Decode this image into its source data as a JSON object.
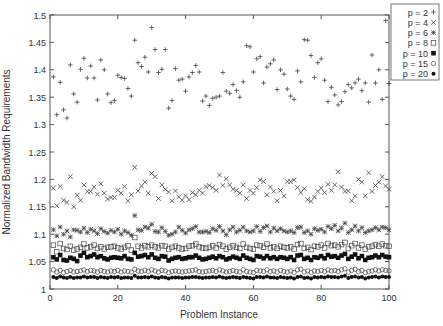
{
  "chart_data": {
    "type": "scatter",
    "title": "",
    "xlabel": "Problem Instance",
    "ylabel": "Normalized Bandwidth Requirements",
    "xlim": [
      0,
      100
    ],
    "ylim": [
      1.0,
      1.5
    ],
    "xticks": [
      0,
      20,
      40,
      60,
      80,
      100
    ],
    "yticks": [
      1,
      1.05,
      1.1,
      1.15,
      1.2,
      1.25,
      1.3,
      1.35,
      1.4,
      1.45,
      1.5
    ],
    "grid": false,
    "legend_position": "upper right, outside plot",
    "series": [
      {
        "name": "p = 2",
        "marker": "plus",
        "values": [
          1.387,
          1.318,
          1.377,
          1.327,
          1.312,
          1.409,
          1.356,
          1.341,
          1.401,
          1.421,
          1.385,
          1.407,
          1.385,
          1.345,
          1.418,
          1.4,
          1.356,
          1.34,
          1.344,
          1.39,
          1.386,
          1.384,
          1.366,
          1.352,
          1.454,
          1.413,
          1.406,
          1.423,
          1.396,
          1.477,
          1.437,
          1.395,
          1.401,
          1.437,
          1.33,
          1.344,
          1.402,
          1.381,
          1.383,
          1.361,
          1.387,
          1.395,
          1.408,
          1.396,
          1.343,
          1.352,
          1.335,
          1.348,
          1.35,
          1.352,
          1.395,
          1.361,
          1.357,
          1.373,
          1.362,
          1.35,
          1.378,
          1.444,
          1.442,
          1.396,
          1.42,
          1.424,
          1.376,
          1.405,
          1.411,
          1.418,
          1.364,
          1.4,
          1.392,
          1.365,
          1.352,
          1.346,
          1.398,
          1.378,
          1.455,
          1.454,
          1.426,
          1.386,
          1.413,
          1.42,
          1.381,
          1.342,
          1.368,
          1.354,
          1.336,
          1.342,
          1.36,
          1.373,
          1.367,
          1.376,
          1.383,
          1.362,
          1.376,
          1.341,
          1.427,
          1.376,
          1.4,
          1.346,
          1.49,
          1.375
        ]
      },
      {
        "name": "p = 4",
        "marker": "cross",
        "values": [
          1.184,
          1.152,
          1.187,
          1.162,
          1.158,
          1.205,
          1.15,
          1.171,
          1.162,
          1.19,
          1.178,
          1.178,
          1.186,
          1.173,
          1.192,
          1.175,
          1.164,
          1.167,
          1.167,
          1.18,
          1.175,
          1.187,
          1.161,
          1.172,
          1.222,
          1.179,
          1.188,
          1.195,
          1.175,
          1.211,
          1.205,
          1.165,
          1.19,
          1.182,
          1.177,
          1.161,
          1.179,
          1.168,
          1.162,
          1.17,
          1.163,
          1.176,
          1.172,
          1.18,
          1.175,
          1.187,
          1.189,
          1.185,
          1.18,
          1.208,
          1.189,
          1.201,
          1.19,
          1.182,
          1.18,
          1.175,
          1.19,
          1.165,
          1.18,
          1.175,
          1.185,
          1.199,
          1.196,
          1.172,
          1.186,
          1.178,
          1.161,
          1.18,
          1.17,
          1.196,
          1.196,
          1.199,
          1.185,
          1.176,
          1.183,
          1.163,
          1.16,
          1.168,
          1.178,
          1.184,
          1.176,
          1.191,
          1.18,
          1.19,
          1.214,
          1.186,
          1.178,
          1.179,
          1.161,
          1.17,
          1.2,
          1.195,
          1.17,
          1.212,
          1.178,
          1.189,
          1.195,
          1.205,
          1.188,
          1.182
        ]
      },
      {
        "name": "p = 6",
        "marker": "star",
        "values": [
          1.108,
          1.097,
          1.113,
          1.1,
          1.106,
          1.095,
          1.108,
          1.107,
          1.104,
          1.111,
          1.103,
          1.109,
          1.106,
          1.101,
          1.11,
          1.105,
          1.102,
          1.107,
          1.104,
          1.109,
          1.1,
          1.106,
          1.103,
          1.098,
          1.134,
          1.108,
          1.107,
          1.113,
          1.111,
          1.118,
          1.105,
          1.104,
          1.112,
          1.105,
          1.098,
          1.1,
          1.104,
          1.113,
          1.107,
          1.102,
          1.108,
          1.11,
          1.114,
          1.104,
          1.104,
          1.105,
          1.103,
          1.11,
          1.107,
          1.114,
          1.106,
          1.099,
          1.108,
          1.113,
          1.104,
          1.107,
          1.113,
          1.106,
          1.104,
          1.106,
          1.114,
          1.105,
          1.112,
          1.115,
          1.104,
          1.111,
          1.106,
          1.11,
          1.106,
          1.104,
          1.106,
          1.103,
          1.112,
          1.113,
          1.103,
          1.106,
          1.1,
          1.11,
          1.107,
          1.109,
          1.104,
          1.114,
          1.11,
          1.116,
          1.106,
          1.111,
          1.12,
          1.103,
          1.108,
          1.115,
          1.106,
          1.112,
          1.103,
          1.106,
          1.108,
          1.112,
          1.108,
          1.113,
          1.112,
          1.108
        ]
      },
      {
        "name": "p = 8",
        "marker": "open-square",
        "values": [
          1.08,
          1.068,
          1.083,
          1.074,
          1.072,
          1.078,
          1.071,
          1.073,
          1.076,
          1.082,
          1.075,
          1.077,
          1.08,
          1.074,
          1.077,
          1.073,
          1.076,
          1.077,
          1.078,
          1.075,
          1.073,
          1.076,
          1.079,
          1.071,
          1.094,
          1.078,
          1.075,
          1.079,
          1.077,
          1.08,
          1.077,
          1.075,
          1.079,
          1.078,
          1.073,
          1.076,
          1.078,
          1.075,
          1.073,
          1.074,
          1.078,
          1.079,
          1.082,
          1.077,
          1.075,
          1.074,
          1.076,
          1.079,
          1.075,
          1.081,
          1.078,
          1.073,
          1.076,
          1.079,
          1.076,
          1.074,
          1.082,
          1.076,
          1.074,
          1.073,
          1.08,
          1.079,
          1.076,
          1.082,
          1.075,
          1.077,
          1.074,
          1.078,
          1.076,
          1.075,
          1.077,
          1.073,
          1.081,
          1.083,
          1.074,
          1.076,
          1.072,
          1.078,
          1.077,
          1.08,
          1.075,
          1.083,
          1.079,
          1.08,
          1.077,
          1.081,
          1.085,
          1.074,
          1.079,
          1.083,
          1.075,
          1.08,
          1.073,
          1.077,
          1.078,
          1.081,
          1.078,
          1.082,
          1.079,
          1.078
        ]
      },
      {
        "name": "p = 10",
        "marker": "filled-square",
        "values": [
          1.058,
          1.054,
          1.062,
          1.053,
          1.052,
          1.057,
          1.055,
          1.051,
          1.061,
          1.066,
          1.058,
          1.06,
          1.063,
          1.058,
          1.06,
          1.056,
          1.054,
          1.057,
          1.058,
          1.057,
          1.056,
          1.06,
          1.055,
          1.054,
          1.066,
          1.059,
          1.06,
          1.062,
          1.058,
          1.063,
          1.057,
          1.055,
          1.06,
          1.059,
          1.052,
          1.055,
          1.057,
          1.058,
          1.055,
          1.056,
          1.058,
          1.058,
          1.061,
          1.057,
          1.054,
          1.055,
          1.057,
          1.059,
          1.056,
          1.06,
          1.058,
          1.054,
          1.056,
          1.059,
          1.057,
          1.055,
          1.061,
          1.057,
          1.055,
          1.053,
          1.06,
          1.059,
          1.056,
          1.06,
          1.056,
          1.058,
          1.055,
          1.058,
          1.057,
          1.055,
          1.058,
          1.053,
          1.061,
          1.062,
          1.055,
          1.057,
          1.053,
          1.058,
          1.057,
          1.06,
          1.056,
          1.062,
          1.059,
          1.06,
          1.057,
          1.061,
          1.064,
          1.055,
          1.059,
          1.063,
          1.056,
          1.06,
          1.053,
          1.057,
          1.058,
          1.061,
          1.058,
          1.062,
          1.059,
          1.058
        ]
      },
      {
        "name": "p = 15",
        "marker": "open-circle",
        "values": [
          1.035,
          1.031,
          1.034,
          1.03,
          1.032,
          1.034,
          1.031,
          1.032,
          1.033,
          1.035,
          1.032,
          1.034,
          1.033,
          1.031,
          1.034,
          1.032,
          1.031,
          1.033,
          1.032,
          1.034,
          1.031,
          1.033,
          1.032,
          1.031,
          1.036,
          1.033,
          1.032,
          1.034,
          1.032,
          1.035,
          1.033,
          1.031,
          1.034,
          1.033,
          1.03,
          1.032,
          1.033,
          1.032,
          1.031,
          1.032,
          1.033,
          1.034,
          1.035,
          1.032,
          1.031,
          1.032,
          1.033,
          1.034,
          1.032,
          1.035,
          1.033,
          1.031,
          1.032,
          1.034,
          1.032,
          1.031,
          1.035,
          1.032,
          1.031,
          1.03,
          1.034,
          1.033,
          1.032,
          1.035,
          1.032,
          1.033,
          1.031,
          1.034,
          1.032,
          1.031,
          1.033,
          1.03,
          1.035,
          1.036,
          1.031,
          1.033,
          1.03,
          1.033,
          1.032,
          1.034,
          1.032,
          1.035,
          1.033,
          1.034,
          1.032,
          1.035,
          1.037,
          1.031,
          1.034,
          1.036,
          1.032,
          1.034,
          1.03,
          1.032,
          1.033,
          1.035,
          1.033,
          1.035,
          1.034,
          1.033
        ]
      },
      {
        "name": "p = 20",
        "marker": "filled-circle",
        "values": [
          1.022,
          1.02,
          1.023,
          1.021,
          1.02,
          1.022,
          1.02,
          1.021,
          1.021,
          1.023,
          1.021,
          1.022,
          1.022,
          1.02,
          1.022,
          1.021,
          1.02,
          1.022,
          1.021,
          1.022,
          1.02,
          1.021,
          1.021,
          1.02,
          1.024,
          1.021,
          1.021,
          1.022,
          1.021,
          1.023,
          1.021,
          1.02,
          1.022,
          1.021,
          1.019,
          1.021,
          1.021,
          1.021,
          1.02,
          1.021,
          1.021,
          1.022,
          1.022,
          1.021,
          1.02,
          1.021,
          1.021,
          1.022,
          1.021,
          1.023,
          1.021,
          1.02,
          1.021,
          1.022,
          1.021,
          1.02,
          1.022,
          1.021,
          1.02,
          1.019,
          1.022,
          1.022,
          1.021,
          1.023,
          1.021,
          1.021,
          1.02,
          1.022,
          1.021,
          1.02,
          1.021,
          1.019,
          1.022,
          1.023,
          1.02,
          1.021,
          1.019,
          1.022,
          1.021,
          1.022,
          1.021,
          1.023,
          1.022,
          1.022,
          1.021,
          1.023,
          1.024,
          1.02,
          1.022,
          1.023,
          1.021,
          1.022,
          1.019,
          1.021,
          1.022,
          1.023,
          1.021,
          1.023,
          1.022,
          1.022
        ]
      }
    ]
  },
  "colors": {
    "axis": "#555555",
    "marker": "#444444",
    "text": "#333333"
  }
}
